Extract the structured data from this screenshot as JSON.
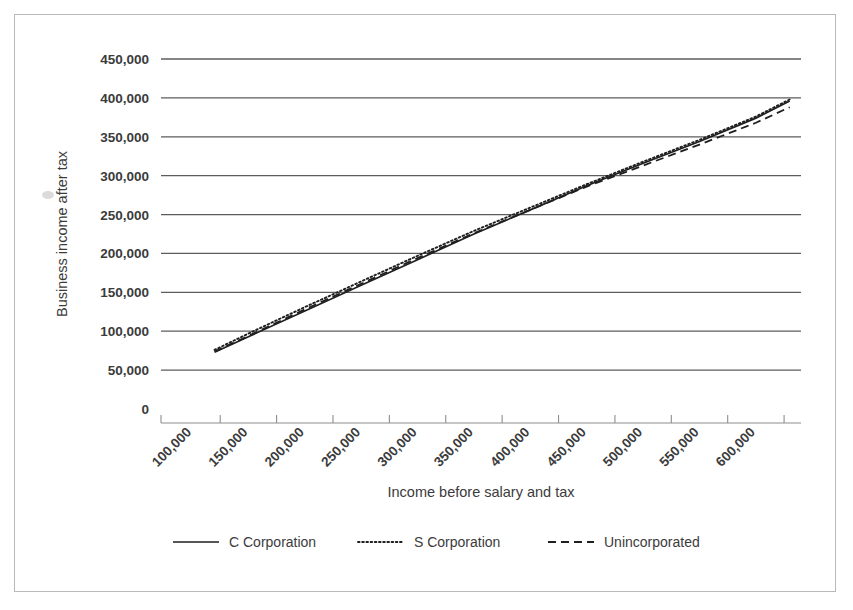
{
  "chart_data": {
    "type": "line",
    "title": "",
    "xlabel": "Income before salary and tax",
    "ylabel": "Business income after tax",
    "xlim": [
      100000,
      600000
    ],
    "ylim": [
      0,
      450000
    ],
    "grid": true,
    "legend_position": "bottom",
    "x_ticks": [
      "100,000",
      "150,000",
      "200,000",
      "250,000",
      "300,000",
      "350,000",
      "400,000",
      "450,000",
      "500,000",
      "550,000",
      "600,000"
    ],
    "y_ticks": [
      "0",
      "50,000",
      "100,000",
      "150,000",
      "200,000",
      "250,000",
      "300,000",
      "350,000",
      "400,000",
      "450,000"
    ],
    "x": [
      120000,
      150000,
      200000,
      250000,
      300000,
      350000,
      400000,
      450000,
      500000,
      550000,
      600000,
      630000
    ],
    "series": [
      {
        "name": "C Corporation",
        "style": "solid",
        "values": [
          73000,
          93000,
          126000,
          159000,
          192000,
          225000,
          256000,
          287000,
          316000,
          344000,
          374000,
          396000
        ]
      },
      {
        "name": "S Corporation",
        "style": "dotted",
        "values": [
          76000,
          97000,
          131000,
          164000,
          197000,
          229000,
          259000,
          289000,
          318000,
          346000,
          376000,
          398000
        ]
      },
      {
        "name": "Unincorporated",
        "style": "dashed",
        "values": [
          74000,
          94000,
          128000,
          161000,
          194000,
          226000,
          256000,
          286000,
          313000,
          340000,
          368000,
          388000
        ]
      }
    ]
  },
  "legend": {
    "items": [
      {
        "label": "C Corporation",
        "style": "solid"
      },
      {
        "label": "S Corporation",
        "style": "dotted"
      },
      {
        "label": "Unincorporated",
        "style": "dashed"
      }
    ]
  },
  "axes": {
    "x_title": "Income before salary and tax",
    "y_title": "Business income after tax"
  }
}
